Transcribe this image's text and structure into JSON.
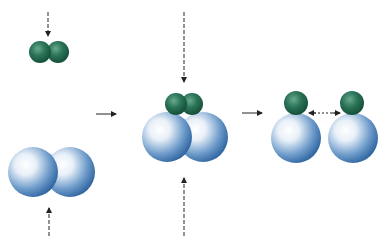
{
  "diagram": {
    "type": "dissociative-adsorption-sequence",
    "stages": [
      {
        "id": "approach",
        "description": "Diatomic green molecule approaching diatomic blue molecule from opposite directions"
      },
      {
        "id": "complex",
        "description": "Green diatomic molecule sits on top of blue diatomic molecule"
      },
      {
        "id": "dissociated",
        "description": "Two separate blue atoms each bearing one green atom, moving apart"
      }
    ],
    "colors": {
      "green": "#1f6b4f",
      "green_highlight": "#5fa386",
      "blue": "#3d74b0",
      "blue_highlight": "#ffffff",
      "arrow": "#222222"
    }
  }
}
